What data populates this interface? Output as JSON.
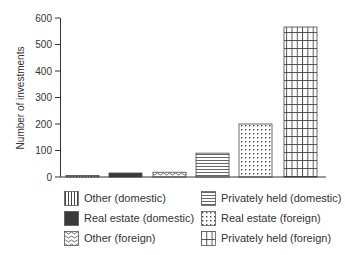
{
  "chart_data": {
    "type": "bar",
    "title": "",
    "xlabel": "",
    "ylabel": "Number of investments",
    "ylim": [
      0,
      600
    ],
    "yticks": [
      0,
      100,
      200,
      300,
      400,
      500,
      600
    ],
    "grid": false,
    "legend_position": "bottom",
    "categories": [
      "Other (domestic)",
      "Real estate (domestic)",
      "Other (foreign)",
      "Privately held (domestic)",
      "Real estate (foreign)",
      "Privately held (foreign)"
    ],
    "values": [
      5,
      15,
      18,
      90,
      200,
      566
    ],
    "patterns": [
      "vertical-lines",
      "solid-dark",
      "waves",
      "horizontal-lines",
      "dots",
      "grid"
    ]
  },
  "legend": {
    "items": [
      {
        "label": "Other (domestic)",
        "pattern": "vertical-lines"
      },
      {
        "label": "Real estate (domestic)",
        "pattern": "solid-dark"
      },
      {
        "label": "Other (foreign)",
        "pattern": "waves"
      },
      {
        "label": "Privately held (domestic)",
        "pattern": "horizontal-lines"
      },
      {
        "label": "Real estate (foreign)",
        "pattern": "dots"
      },
      {
        "label": "Privately held (foreign)",
        "pattern": "grid"
      }
    ]
  },
  "colors": {
    "ink": "#333333",
    "dark_fill": "#3a3a3a",
    "background": "#ffffff"
  }
}
